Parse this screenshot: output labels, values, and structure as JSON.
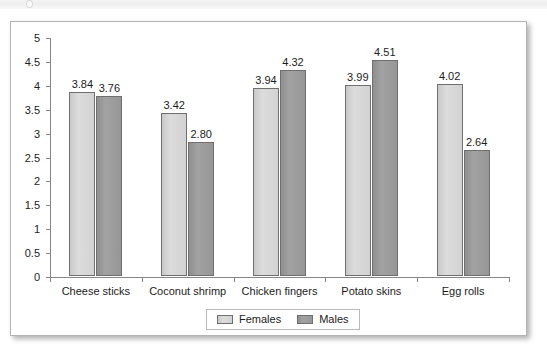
{
  "chart_data": {
    "type": "bar",
    "title": "",
    "subtitle": "",
    "xlabel": "",
    "ylabel": "",
    "categories": [
      "Cheese sticks",
      "Coconut shrimp",
      "Chicken fingers",
      "Potato skins",
      "Egg rolls"
    ],
    "series": [
      {
        "name": "Females",
        "color": "#d2d2d2",
        "values": [
          3.84,
          3.42,
          3.94,
          3.99,
          4.02
        ],
        "labels": [
          "3.84",
          "3.42",
          "3.94",
          "3.99",
          "4.02"
        ]
      },
      {
        "name": "Males",
        "color": "#969696",
        "values": [
          3.76,
          2.8,
          4.32,
          4.51,
          2.64
        ],
        "labels": [
          "3.76",
          "2.80",
          "4.32",
          "4.51",
          "2.64"
        ]
      }
    ],
    "ylim": [
      0,
      5
    ],
    "ytick_labels": [
      "5",
      "4.5",
      "4",
      "3.5",
      "3",
      "2.5",
      "2",
      "1.5",
      "1",
      "0.5",
      "0"
    ],
    "ytick_values": [
      5,
      4.5,
      4,
      3.5,
      3,
      2.5,
      2,
      1.5,
      1,
      0.5,
      0
    ],
    "grid": false,
    "legend_position": "bottom",
    "data_labels_shown": true,
    "bar_border_color": "#6f6f6f",
    "axis_color": "#878787"
  },
  "legend": {
    "items": [
      {
        "label": "Females",
        "swatch": "females"
      },
      {
        "label": "Males",
        "swatch": "males"
      }
    ]
  }
}
